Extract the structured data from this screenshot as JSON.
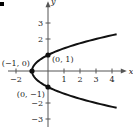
{
  "chart_data": {
    "type": "line",
    "title": "",
    "xlabel": "x",
    "ylabel": "y",
    "equation": "x = y^2 - 1",
    "xlim": [
      -2.5,
      4.8
    ],
    "ylim": [
      -3.5,
      4.3
    ],
    "x_ticks": [
      -2,
      1,
      2,
      3,
      4
    ],
    "y_ticks": [
      3,
      2,
      -2,
      -3
    ],
    "x_tick_labels": [
      "−2",
      "1",
      "2",
      "3",
      "4"
    ],
    "y_tick_labels": [
      "3",
      "2",
      "−2",
      "−3"
    ],
    "grid": false,
    "series": [
      {
        "name": "parabola",
        "parametric": "x = t^2 - 1, y = t",
        "t_range": [
          -2.3,
          2.3
        ]
      }
    ],
    "points": [
      {
        "x": -1,
        "y": 0,
        "label": "(−1, 0)"
      },
      {
        "x": 0,
        "y": 1,
        "label": "(0, 1)"
      },
      {
        "x": 0,
        "y": -1,
        "label": "(0, −1)"
      }
    ]
  }
}
